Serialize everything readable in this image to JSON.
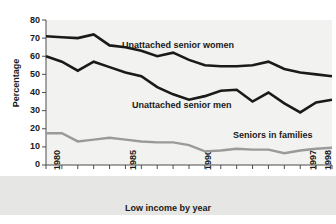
{
  "chart_data": {
    "type": "line",
    "title": "",
    "xlabel": "Low income by year",
    "ylabel": "Percentage",
    "ylim": [
      0,
      80
    ],
    "ytick_labels": [
      "0",
      "10",
      "20",
      "30",
      "40",
      "50",
      "60",
      "70",
      "80"
    ],
    "ytick_values": [
      0,
      10,
      20,
      30,
      40,
      50,
      60,
      70,
      80
    ],
    "xlim": [
      1980,
      1998
    ],
    "x": [
      1980,
      1981,
      1982,
      1983,
      1984,
      1985,
      1986,
      1987,
      1988,
      1989,
      1990,
      1991,
      1992,
      1993,
      1994,
      1995,
      1996,
      1997,
      1998
    ],
    "xtick_labels": [
      "1980",
      "1985",
      "1990",
      "1997",
      "1998"
    ],
    "xtick_values": [
      1980,
      1985,
      1990,
      1997,
      1998
    ],
    "grid": false,
    "legend_position": "inline-annotations",
    "series": [
      {
        "name": "Unattached senior women",
        "color": "#1a1a1a",
        "values": [
          71,
          70.5,
          70,
          72,
          66,
          65,
          63,
          60,
          62,
          58,
          55,
          54.5,
          54.5,
          55,
          57,
          53,
          51,
          50,
          49
        ]
      },
      {
        "name": "Unattached senior men",
        "color": "#1a1a1a",
        "values": [
          60,
          57,
          52,
          57,
          54,
          51,
          49,
          43,
          39,
          36,
          38,
          41,
          41.5,
          35,
          40,
          34,
          29,
          34.5,
          36
        ]
      },
      {
        "name": "Seniors in families",
        "color": "#9a9a9a",
        "values": [
          17.5,
          17.5,
          13,
          14,
          15,
          14,
          13,
          12.5,
          12.5,
          11,
          7.5,
          8,
          9,
          8.5,
          8.5,
          6.5,
          8,
          9,
          9.5
        ]
      }
    ],
    "annotations": [
      {
        "text": "Unattached senior women",
        "x_px": 122,
        "y_px": 40
      },
      {
        "text": "Unattached senior men",
        "x_px": 132,
        "y_px": 100
      },
      {
        "text": "Seniors in families",
        "x_px": 233,
        "y_px": 130
      }
    ]
  }
}
